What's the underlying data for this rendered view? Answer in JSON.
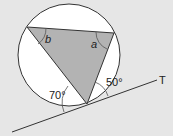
{
  "diagram": {
    "type": "circle-theorem",
    "colors": {
      "background": "#e6e6e6",
      "circle_fill": "#ffffff",
      "triangle_fill": "#b3b3b3",
      "stroke": "#333333"
    },
    "labels": {
      "angle_b": "b",
      "angle_a": "a",
      "angle_70": "70°",
      "angle_50": "50°",
      "tangent": "T"
    }
  }
}
